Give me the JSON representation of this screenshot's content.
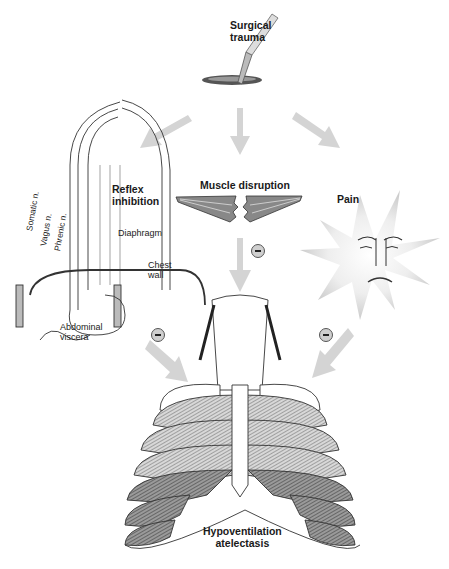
{
  "title": "Surgical trauma",
  "nodes": {
    "source": {
      "line1": "Surgical",
      "line2": "trauma"
    },
    "reflex": {
      "line1": "Reflex",
      "line2": "inhibition"
    },
    "muscle": {
      "label": "Muscle disruption"
    },
    "pain": {
      "label": "Pain"
    },
    "outcome": {
      "line1": "Hypoventilation",
      "line2": "atelectasis"
    }
  },
  "anatomy_labels": {
    "somatic": "Somatic n.",
    "vagus": "Vagus n.",
    "phrenic": "Phrenic n.",
    "diaphragm": "Diaphragm",
    "chest_wall_1": "Chest",
    "chest_wall_2": "wall",
    "abdominal_1": "Abdominal",
    "abdominal_2": "viscera"
  },
  "inhibition_markers": [
    {
      "symbol": "−",
      "meaning": "inhibition",
      "from": "muscle"
    },
    {
      "symbol": "−",
      "meaning": "inhibition",
      "from": "reflex"
    },
    {
      "symbol": "−",
      "meaning": "inhibition",
      "from": "pain"
    }
  ],
  "colors": {
    "arrow": "#d0d0d0",
    "line": "#333333",
    "hatch": "#7a7a7a"
  }
}
